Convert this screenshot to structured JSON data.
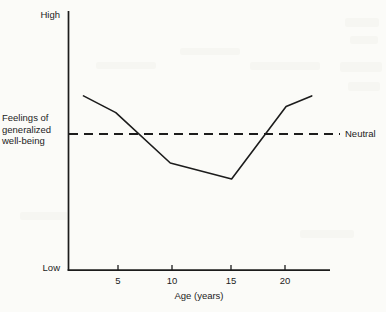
{
  "figure": {
    "background_color": "#fbfbf8",
    "ink_color": "#1c1c1c"
  },
  "axes": {
    "y_top_label": "High",
    "y_bottom_label": "Low",
    "y_axis_title_line1": "Feelings of",
    "y_axis_title_line2": "generalized",
    "y_axis_title_line3": "well-being",
    "y_axis_title": "Feelings of generalized well-being",
    "x_axis_title": "Age (years)",
    "x_tick_labels": [
      "5",
      "10",
      "15",
      "20"
    ]
  },
  "reference_line": {
    "label": "Neutral",
    "style": "dashed",
    "value": 0
  },
  "chart_data": {
    "type": "line",
    "title": "",
    "subtitle": "",
    "xlabel": "Age (years)",
    "ylabel": "Feelings of generalized well-being",
    "xlim": [
      0,
      24
    ],
    "ylim": [
      -1,
      1
    ],
    "ytick_labels": [
      "Low",
      "High"
    ],
    "xtick_values": [
      5,
      10,
      15,
      20
    ],
    "grid": false,
    "legend": "none",
    "annotations": [
      {
        "text": "Neutral",
        "y": 0,
        "position": "right-of-axis"
      },
      {
        "text": "High",
        "y": 1,
        "position": "top-of-y-axis"
      },
      {
        "text": "Low",
        "y": -1,
        "position": "bottom-of-y-axis"
      }
    ],
    "series": [
      {
        "name": "Feelings of generalized well-being",
        "x": [
          1.9,
          4.8,
          9.7,
          15.2,
          20.1,
          22.4
        ],
        "y": [
          0.32,
          0.18,
          -0.22,
          -0.34,
          0.23,
          0.32
        ]
      }
    ],
    "reference_lines": [
      {
        "orientation": "horizontal",
        "y": 0,
        "label": "Neutral",
        "dash": true
      }
    ]
  }
}
